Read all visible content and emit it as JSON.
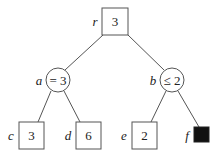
{
  "diagram": {
    "type": "game-tree",
    "nodes": {
      "r": {
        "label": "r",
        "value": "3",
        "shape": "square"
      },
      "a": {
        "label": "a",
        "value": "= 3",
        "shape": "circle"
      },
      "b": {
        "label": "b",
        "value": "≤ 2",
        "shape": "circle"
      },
      "c": {
        "label": "c",
        "value": "3",
        "shape": "square"
      },
      "d": {
        "label": "d",
        "value": "6",
        "shape": "square"
      },
      "e": {
        "label": "e",
        "value": "2",
        "shape": "square"
      },
      "f": {
        "label": "f",
        "value": "",
        "shape": "filled-square"
      }
    },
    "edges": [
      [
        "r",
        "a"
      ],
      [
        "r",
        "b"
      ],
      [
        "a",
        "c"
      ],
      [
        "a",
        "d"
      ],
      [
        "b",
        "e"
      ],
      [
        "b",
        "f"
      ]
    ]
  }
}
